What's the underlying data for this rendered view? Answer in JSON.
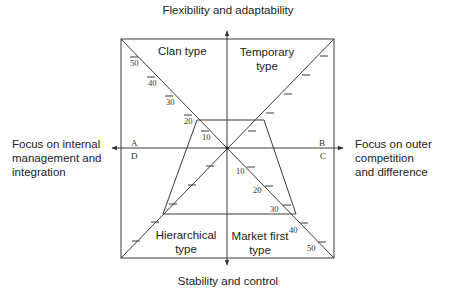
{
  "diagram": {
    "axes": {
      "top": "Flexibility and adaptability",
      "bottom": "Stability and control",
      "left": [
        "Focus on internal",
        "management and",
        "integration"
      ],
      "right": [
        "Focus on outer",
        "competition",
        "and difference"
      ]
    },
    "quadrants": {
      "top_left": [
        "Clan type"
      ],
      "top_right": [
        "Temporary",
        "type"
      ],
      "bottom_left": [
        "Hierarchical",
        "type"
      ],
      "bottom_right": [
        "Market first",
        "type"
      ]
    },
    "corner_letters": {
      "A": "A",
      "B": "B",
      "C": "C",
      "D": "D"
    },
    "diagonal_upper_left_ticks": [
      "50",
      "40",
      "30",
      "20",
      "10"
    ],
    "diagonal_lower_right_ticks": [
      "10",
      "20",
      "30",
      "40",
      "50"
    ],
    "colors": {
      "line": "#3a3a3a",
      "text": "#222222",
      "background": "#ffffff"
    }
  }
}
